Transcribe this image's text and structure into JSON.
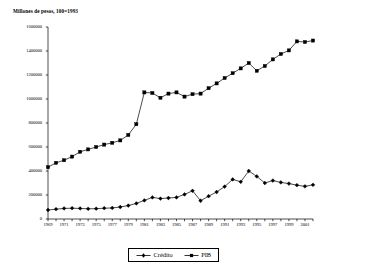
{
  "chart_data": {
    "type": "line",
    "title": "Millones de pesos, 100=1993",
    "xlabel": "",
    "ylabel": "",
    "xlim": [
      1969,
      2002
    ],
    "ylim": [
      0,
      1600000
    ],
    "ytick_values": [
      0,
      200000,
      400000,
      600000,
      800000,
      1000000,
      1200000,
      1400000,
      1600000
    ],
    "ytick_labels": [
      "0",
      "200000",
      "400000",
      "600000",
      "800000",
      "1000000",
      "1200000",
      "1400000",
      "1600000"
    ],
    "xtick_values": [
      1969,
      1971,
      1973,
      1975,
      1977,
      1979,
      1981,
      1983,
      1985,
      1987,
      1989,
      1991,
      1993,
      1995,
      1997,
      1999,
      2001
    ],
    "xtick_labels": [
      "1969",
      "1971",
      "1973",
      "1975",
      "1977",
      "1979",
      "1981",
      "1983",
      "1985",
      "1987",
      "1989",
      "1991",
      "1993",
      "1995",
      "1997",
      "1999",
      "2001"
    ],
    "grid": false,
    "legend_position": "bottom-center",
    "x": [
      1969,
      1970,
      1971,
      1972,
      1973,
      1974,
      1975,
      1976,
      1977,
      1978,
      1979,
      1980,
      1981,
      1982,
      1983,
      1984,
      1985,
      1986,
      1987,
      1988,
      1989,
      1990,
      1991,
      1992,
      1993,
      1994,
      1995,
      1996,
      1997,
      1998,
      1999,
      2000,
      2001,
      2002
    ],
    "series": [
      {
        "name": "Crédito",
        "marker": "diamond",
        "color": "#000000",
        "values": [
          75000,
          82000,
          88000,
          90000,
          88000,
          85000,
          86000,
          90000,
          92000,
          100000,
          112000,
          130000,
          155000,
          180000,
          170000,
          175000,
          180000,
          205000,
          235000,
          152000,
          190000,
          225000,
          270000,
          330000,
          310000,
          400000,
          355000,
          300000,
          320000,
          305000,
          295000,
          282000,
          272000,
          285000
        ]
      },
      {
        "name": "PIB",
        "marker": "square",
        "color": "#000000",
        "values": [
          432000,
          468000,
          490000,
          520000,
          560000,
          580000,
          600000,
          620000,
          635000,
          655000,
          700000,
          790000,
          1055000,
          1050000,
          1010000,
          1045000,
          1055000,
          1020000,
          1040000,
          1045000,
          1090000,
          1130000,
          1175000,
          1215000,
          1255000,
          1300000,
          1235000,
          1275000,
          1330000,
          1375000,
          1405000,
          1480000,
          1475000,
          1487000
        ]
      }
    ]
  },
  "legend": {
    "items": [
      {
        "label": "Crédito"
      },
      {
        "label": "PIB"
      }
    ]
  }
}
